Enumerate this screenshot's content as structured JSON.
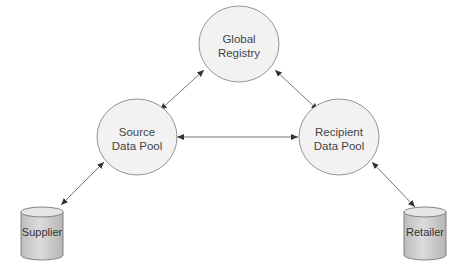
{
  "diagram": {
    "nodes": {
      "global_registry": {
        "line1": "Global",
        "line2": "Registry",
        "shape": "circle"
      },
      "source_pool": {
        "line1": "Source",
        "line2": "Data Pool",
        "shape": "circle"
      },
      "recipient_pool": {
        "line1": "Recipient",
        "line2": "Data Pool",
        "shape": "circle"
      },
      "supplier": {
        "label": "Supplier",
        "shape": "cylinder"
      },
      "retailer": {
        "label": "Retailer",
        "shape": "cylinder"
      }
    },
    "edges": [
      {
        "from": "Source Data Pool",
        "to": "Global Registry",
        "direction": "bidirectional"
      },
      {
        "from": "Recipient Data Pool",
        "to": "Global Registry",
        "direction": "bidirectional"
      },
      {
        "from": "Source Data Pool",
        "to": "Recipient Data Pool",
        "direction": "bidirectional"
      },
      {
        "from": "Supplier",
        "to": "Source Data Pool",
        "direction": "bidirectional"
      },
      {
        "from": "Retailer",
        "to": "Recipient Data Pool",
        "direction": "bidirectional"
      }
    ],
    "colors": {
      "node_fill": "#f0f0f0",
      "node_stroke": "#8a8a8a",
      "edge": "#555555",
      "cylinder_fill": "#cfcfcf"
    }
  }
}
